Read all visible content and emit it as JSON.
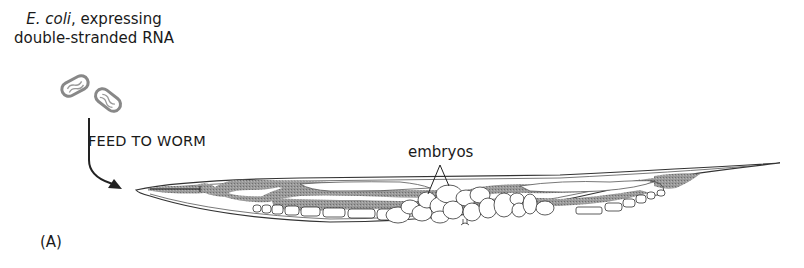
{
  "figure": {
    "caption_line1_italic": "E. coli",
    "caption_line1_rest": ", expressing",
    "caption_line2": "double-stranded RNA",
    "step_label": "FEED TO WORM",
    "annotation_label": "embryos",
    "panel_label": "(A)"
  },
  "elements": {
    "bacteria_count": 2,
    "subject": "worm (C. elegans) with gut and embryos"
  },
  "colors": {
    "outline": "#333333",
    "gut_shading": "#8c8c8c",
    "background": "#ffffff"
  }
}
